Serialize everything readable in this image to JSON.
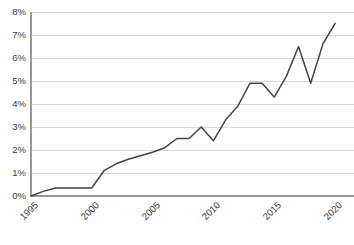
{
  "chart_data": {
    "type": "line",
    "title": "",
    "subtitle": "",
    "xlabel": "",
    "ylabel": "",
    "xlim": [
      1995,
      2020
    ],
    "ylim": [
      0,
      8
    ],
    "grid": true,
    "grid_axis": "y",
    "legend": false,
    "legend_position": "none",
    "value_suffix": "%",
    "line_color": "#444444",
    "grid_color": "#d9d9d9",
    "axis_color": "#999999",
    "background_color": "#ffffff",
    "text_color": "#3a3a3a",
    "x_tick_labels": [
      "1995",
      "2000",
      "2005",
      "2010",
      "2015",
      "2020"
    ],
    "x_tick_values": [
      1995,
      2000,
      2005,
      2010,
      2015,
      2020
    ],
    "y_tick_labels": [
      "0%",
      "1%",
      "2%",
      "3%",
      "4%",
      "5%",
      "6%",
      "7%",
      "8%"
    ],
    "y_tick_values": [
      0,
      1,
      2,
      3,
      4,
      5,
      6,
      7,
      8
    ],
    "x": [
      1995,
      1996,
      1997,
      1998,
      1999,
      2000,
      2001,
      2002,
      2003,
      2004,
      2005,
      2006,
      2007,
      2008,
      2009,
      2010,
      2011,
      2012,
      2013,
      2014,
      2015,
      2016,
      2017,
      2018,
      2019,
      2020
    ],
    "values": [
      0.0,
      0.2,
      0.35,
      0.35,
      0.35,
      0.35,
      1.1,
      1.4,
      1.6,
      1.75,
      1.9,
      2.1,
      2.5,
      2.5,
      3.0,
      2.4,
      3.3,
      3.9,
      4.9,
      4.9,
      4.3,
      5.2,
      6.5,
      4.9,
      6.6,
      7.5
    ],
    "series": [
      {
        "name": "",
        "values": [
          0.0,
          0.2,
          0.35,
          0.35,
          0.35,
          0.35,
          1.1,
          1.4,
          1.6,
          1.75,
          1.9,
          2.1,
          2.5,
          2.5,
          3.0,
          2.4,
          3.3,
          3.9,
          4.9,
          4.9,
          4.3,
          5.2,
          6.5,
          4.9,
          6.6,
          7.5
        ]
      }
    ]
  }
}
